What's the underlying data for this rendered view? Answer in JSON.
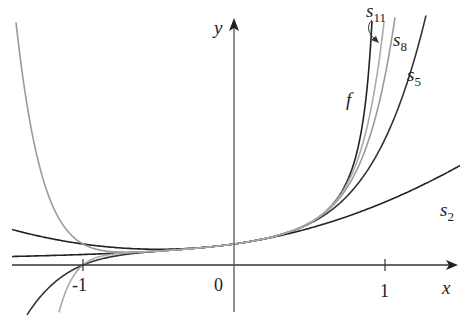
{
  "diagram": {
    "title": "",
    "axes": {
      "x_label": "x",
      "y_label": "y",
      "origin_label": "0",
      "ticks": [
        "-1",
        "1"
      ]
    },
    "curves": [
      {
        "name": "f",
        "label": "f",
        "color": "#222222",
        "expr": "1/(1-x)"
      },
      {
        "name": "s2",
        "label": "s",
        "sub": "2",
        "color": "#222222",
        "n": 2
      },
      {
        "name": "s5",
        "label": "s",
        "sub": "5",
        "color": "#333333",
        "n": 5
      },
      {
        "name": "s8",
        "label": "s",
        "sub": "8",
        "color": "#9a9a9a",
        "n": 8
      },
      {
        "name": "s11",
        "label": "s",
        "sub": "11",
        "color": "#aaaaaa",
        "n": 11
      }
    ],
    "origin_px": [
      234,
      265
    ],
    "scale_px": [
      151,
      21
    ],
    "x_range": [
      -1.5,
      1.5
    ],
    "y_range": [
      -2.5,
      12.5
    ]
  }
}
